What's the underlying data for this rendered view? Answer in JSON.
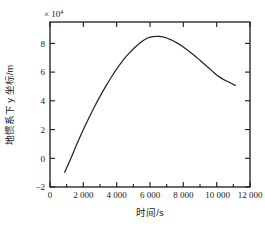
{
  "chart_data": {
    "type": "line",
    "title": "",
    "xlabel": "时间/s",
    "ylabel": "地惯系下 y 坐标/m",
    "y_exponent_label": "× 10",
    "y_exponent_power": "4",
    "xlim": [
      -800,
      12800
    ],
    "ylim": [
      -2,
      9.2
    ],
    "xticks": [
      0,
      2000,
      4000,
      6000,
      8000,
      10000,
      12000
    ],
    "xticklabels": [
      "0",
      "2 000",
      "4 000",
      "6 000",
      "8 000",
      "10 000",
      "12 000"
    ],
    "yticks": [
      -2,
      0,
      2,
      4,
      6,
      8
    ],
    "yticklabels": [
      "−2",
      "0",
      "2",
      "4",
      "6",
      "8"
    ],
    "grid": false,
    "legend": null,
    "line_color": "#262626",
    "series": [
      {
        "name": "y坐标",
        "x": [
          200,
          600,
          1000,
          1400,
          1800,
          2200,
          2600,
          3000,
          3400,
          3800,
          4200,
          4600,
          5000,
          5400,
          5800,
          6200,
          6600,
          7000,
          7400,
          7800,
          8200,
          8600,
          9000,
          9400,
          9800,
          10200,
          10600,
          11000,
          11400,
          11800
        ],
        "values": [
          -1.0,
          -0.1,
          0.85,
          1.75,
          2.6,
          3.4,
          4.15,
          4.85,
          5.5,
          6.1,
          6.65,
          7.1,
          7.5,
          7.85,
          8.1,
          8.2,
          8.22,
          8.15,
          8.0,
          7.8,
          7.55,
          7.25,
          6.95,
          6.6,
          6.25,
          5.9,
          5.55,
          5.3,
          5.1,
          4.9
        ]
      }
    ],
    "annotations": {
      "start_value": -1.0,
      "peak_value": 8.22,
      "peak_time": 6600,
      "end_value": 4.9,
      "units": "1e4 m"
    }
  }
}
